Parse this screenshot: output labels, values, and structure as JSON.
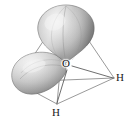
{
  "figure": {
    "background_color": "#ffffff",
    "line_color": "#6f6f6f",
    "lobe_light": "#e4e4e4",
    "lobe_mid": "#b6b6b6",
    "lobe_dark": "#6d6d6d",
    "lobe_edge": "#5a5a5a"
  },
  "atoms": {
    "center": {
      "label": "O",
      "name": "oxygen",
      "x": 66,
      "y": 64
    },
    "hydrogens": [
      {
        "label": "H",
        "name": "hydrogen-right",
        "x": 120,
        "y": 78
      },
      {
        "label": "H",
        "name": "hydrogen-bottom",
        "x": 56,
        "y": 112
      }
    ]
  },
  "orbitals": [
    {
      "name": "lone-pair-lobe-up",
      "shape": "teardrop",
      "direction": "up",
      "apex_x": 66,
      "apex_y": 63,
      "tip_x": 66,
      "tip_y": 7
    },
    {
      "name": "lone-pair-lobe-left",
      "shape": "teardrop",
      "direction": "left-down",
      "apex_x": 66,
      "apex_y": 64,
      "tip_x": 14,
      "tip_y": 75
    }
  ],
  "tetrahedron": {
    "name": "tetrahedral-wireframe",
    "vertices": [
      {
        "name": "vertex-top",
        "x": 66,
        "y": 7
      },
      {
        "name": "vertex-left",
        "x": 16,
        "y": 82
      },
      {
        "name": "vertex-right",
        "x": 114,
        "y": 78
      },
      {
        "name": "vertex-bottom",
        "x": 57,
        "y": 104
      }
    ],
    "edge_count": 6
  }
}
